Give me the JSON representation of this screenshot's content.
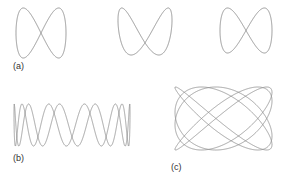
{
  "panels": {
    "a": {
      "label": "(a)"
    },
    "b": {
      "label": "(b)"
    },
    "c": {
      "label": "(c)"
    }
  },
  "colors": {
    "curve": "#8a8a8a",
    "background": "#ffffff",
    "text": "#333333"
  },
  "curves": [
    {
      "id": "a1",
      "desc": "figure-eight Lissajous, ratio 1:2",
      "box": [
        16,
        8,
        66,
        58
      ]
    },
    {
      "id": "a2",
      "desc": "bent loop Lissajous, ratio 2:1 near-phase",
      "box": [
        118,
        8,
        172,
        55
      ]
    },
    {
      "id": "a3",
      "desc": "parabola Lissajous, ratio 2:1 degenerate",
      "box": [
        220,
        8,
        272,
        53
      ]
    },
    {
      "id": "b",
      "desc": "zigzag Lissajous, high frequency ratio",
      "box": [
        14,
        104,
        130,
        146
      ]
    },
    {
      "id": "c",
      "desc": "dense Lissajous, ratio ~5:4",
      "box": [
        175,
        87,
        272,
        150
      ]
    }
  ]
}
